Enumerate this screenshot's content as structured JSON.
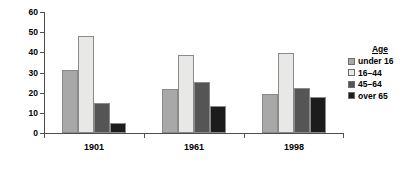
{
  "chart_data": {
    "type": "bar",
    "title": "",
    "xlabel": "",
    "ylabel": "Number of women in the UK (%)",
    "categories": [
      "1901",
      "1961",
      "1998"
    ],
    "series": [
      {
        "name": "under 16",
        "color": "#a8a8a8",
        "values": [
          31,
          22,
          19.5
        ]
      },
      {
        "name": "16–44",
        "color": "#e8e8e6",
        "values": [
          48,
          38.5,
          39.5
        ]
      },
      {
        "name": "45–64",
        "color": "#555555",
        "values": [
          15,
          25.5,
          22.5
        ]
      },
      {
        "name": "over 65",
        "color": "#1c1c1c",
        "values": [
          5,
          13.5,
          18
        ]
      }
    ],
    "ylim": [
      0,
      60
    ],
    "yticks": [
      0,
      10,
      20,
      30,
      40,
      50,
      60
    ],
    "ytick_labels": [
      "0",
      "10",
      "20",
      "30",
      "40",
      "50",
      "60"
    ],
    "grid": false,
    "legend_position": "right",
    "legend_title": "Age"
  },
  "axis": {
    "y_title": "Number of women in the UK (%)",
    "y_labels": [
      "60",
      "50",
      "40",
      "30",
      "20",
      "10",
      "0"
    ],
    "x_labels": [
      "1901",
      "1961",
      "1998"
    ]
  },
  "legend": {
    "title": "Age",
    "items": [
      {
        "label": "under 16",
        "color": "#a8a8a8"
      },
      {
        "label": "16–44",
        "color": "#e8e8e6"
      },
      {
        "label": "45–64",
        "color": "#555555"
      },
      {
        "label": "over 65",
        "color": "#1c1c1c"
      }
    ]
  }
}
